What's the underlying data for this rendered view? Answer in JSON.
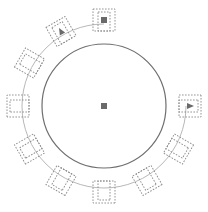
{
  "diagram": {
    "type": "floor-plan-round-table",
    "canvas": {
      "width": 208,
      "height": 212
    },
    "colors": {
      "background": "#ffffff",
      "table_stroke": "#6e6e6e",
      "ring_stroke": "#b8b8b8",
      "chair_stroke": "#8a8a8a",
      "marker_fill": "#6a6a6a"
    },
    "table": {
      "cx": 104,
      "cy": 106,
      "r": 62,
      "center_marker": "square"
    },
    "ring": {
      "cx": 104,
      "cy": 106,
      "r": 82,
      "start_angle": -90,
      "end_angle": 0,
      "direction": "counterclockwise-long-way"
    },
    "chair": {
      "radius": 86,
      "size": 22,
      "inner_offset": 5
    },
    "chairs": [
      {
        "id": "chair-top",
        "angle": -90,
        "marker": "square"
      },
      {
        "id": "chair-upper-left",
        "angle": -120,
        "marker": "triangle"
      },
      {
        "id": "chair-left-upper",
        "angle": -150,
        "marker": "none"
      },
      {
        "id": "chair-left",
        "angle": 180,
        "marker": "none"
      },
      {
        "id": "chair-left-lower",
        "angle": 150,
        "marker": "none"
      },
      {
        "id": "chair-lower-left",
        "angle": 120,
        "marker": "none"
      },
      {
        "id": "chair-bottom",
        "angle": 90,
        "marker": "none"
      },
      {
        "id": "chair-lower-right",
        "angle": 60,
        "marker": "none"
      },
      {
        "id": "chair-right-lower",
        "angle": 30,
        "marker": "none"
      },
      {
        "id": "chair-right",
        "angle": 0,
        "marker": "triangle"
      }
    ]
  }
}
